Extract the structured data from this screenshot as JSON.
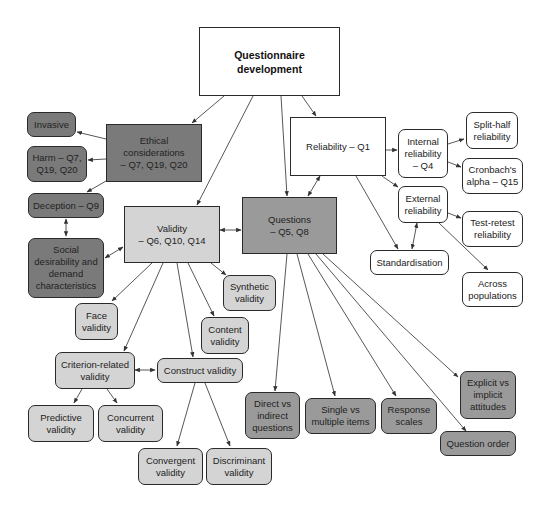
{
  "diagram": {
    "title": "Questionnaire development",
    "colors": {
      "white": "#ffffff",
      "light_gray": "#d4d4d4",
      "mid_gray": "#9a9a9a",
      "dark_gray": "#7a7a7a",
      "border": "#2a2a2a"
    },
    "nodes": {
      "root": "Questionnaire\ndevelopment",
      "ethical": "Ethical\nconsiderations\n– Q7, Q19, Q20",
      "invasive": "Invasive",
      "harm": "Harm – Q7,\nQ19, Q20",
      "deception": "Deception – Q9",
      "social": "Social\ndesirability and\ndemand\ncharacteristics",
      "validity": "Validity\n– Q6, Q10, Q14",
      "questions": "Questions\n– Q5, Q8",
      "reliability": "Reliability – Q1",
      "internal": "Internal\nreliability\n– Q4",
      "splithalf": "Split-half\nreliability",
      "cronbach": "Cronbach's\nalpha – Q15",
      "external": "External\nreliability",
      "testretest": "Test-retest\nreliability",
      "standardisation": "Standardisation",
      "across": "Across\npopulations",
      "face": "Face\nvalidity",
      "synthetic": "Synthetic\nvalidity",
      "content": "Content\nvalidity",
      "criterion": "Criterion-related\nvalidity",
      "construct": "Construct validity",
      "predictive": "Predictive\nvalidity",
      "concurrent": "Concurrent\nvalidity",
      "convergent": "Convergent\nvalidity",
      "discriminant": "Discriminant\nvalidity",
      "direct": "Direct vs\nindirect\nquestions",
      "single": "Single vs\nmultiple items",
      "response": "Response\nscales",
      "explicit": "Explicit vs\nimplicit\nattitudes",
      "order": "Question order"
    }
  }
}
